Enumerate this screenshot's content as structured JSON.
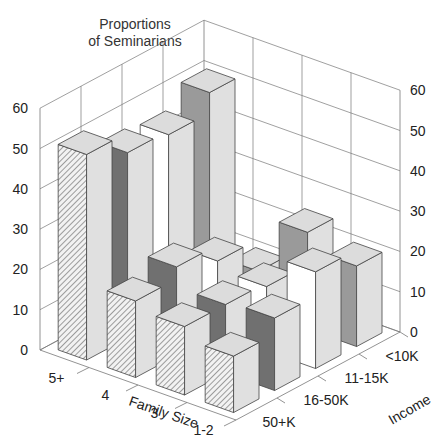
{
  "chart_data": {
    "type": "bar3d",
    "title": "Proportions of Seminarians",
    "title_lines": [
      "Proportions",
      "of Seminarians"
    ],
    "xlabel": "Family Size",
    "ylabel": "Income",
    "zlabel": "Proportions of Seminarians",
    "zlim": [
      0,
      60
    ],
    "z_ticks": [
      0,
      10,
      20,
      30,
      40,
      50,
      60
    ],
    "family_sizes": [
      "5+",
      "4",
      "3",
      "1-2"
    ],
    "income_levels": [
      "50+K",
      "16-50K",
      "11-15K",
      "<10K"
    ],
    "series": [
      {
        "name": "50+K",
        "pattern": "hatched",
        "values": [
          51,
          19,
          17,
          14
        ]
      },
      {
        "name": "16-50K",
        "pattern": "dark-gray",
        "values": [
          46,
          22,
          17,
          18
        ]
      },
      {
        "name": "11-15K",
        "pattern": "white",
        "values": [
          45,
          18,
          16,
          24
        ]
      },
      {
        "name": "<10K",
        "pattern": "medium-gray",
        "values": [
          50,
          10,
          24,
          20
        ]
      }
    ],
    "grid": true,
    "legend": "none"
  },
  "colors": {
    "50+K": "#e8e8e8",
    "16-50K": "#707070",
    "11-15K": "#ffffff",
    "<10K": "#9a9a9a",
    "side": "#e0e0e0",
    "top": "#dcdcdc",
    "grid": "#777777"
  }
}
